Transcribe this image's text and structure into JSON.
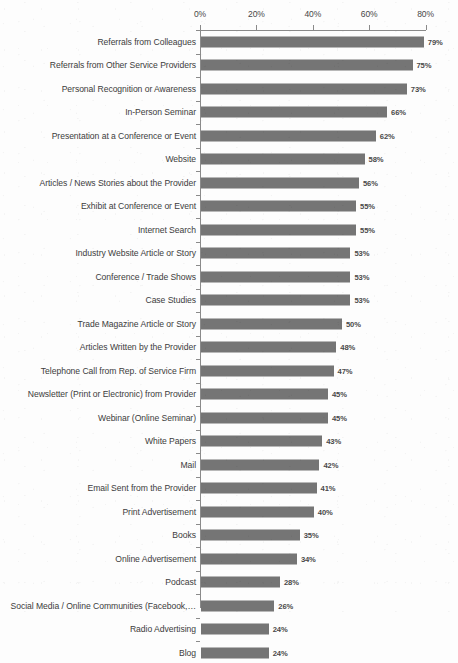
{
  "chart_data": {
    "type": "bar",
    "orientation": "horizontal",
    "title": "",
    "subtitle": "",
    "xlabel": "",
    "ylabel": "",
    "xlim": [
      0,
      80
    ],
    "xticks": [
      0,
      20,
      40,
      60,
      80
    ],
    "xtick_labels": [
      "0%",
      "20%",
      "40%",
      "60%",
      "80%"
    ],
    "grid": false,
    "legend": null,
    "value_label_suffix": "%",
    "bar_color": "#757575",
    "axis_color": "#8a8a8a",
    "text_color": "#3c3c3c",
    "background_color": "#fdfdfd",
    "categories": [
      "Referrals from Colleagues",
      "Referrals from Other Service Providers",
      "Personal Recognition or Awareness",
      "In-Person Seminar",
      "Presentation at a Conference or Event",
      "Website",
      "Articles / News Stories about the Provider",
      "Exhibit at Conference or Event",
      "Internet Search",
      "Industry Website Article or Story",
      "Conference / Trade Shows",
      "Case Studies",
      "Trade Magazine Article or Story",
      "Articles Written by the Provider",
      "Telephone Call from Rep. of  Service Firm",
      "Newsletter (Print or Electronic) from Provider",
      "Webinar (Online Seminar)",
      "White Papers",
      "Mail",
      "Email Sent from the Provider",
      "Print Advertisement",
      "Books",
      "Online Advertisement",
      "Podcast",
      "Social Media / Online Communities (Facebook,…",
      "Radio Advertising",
      "Blog"
    ],
    "values": [
      79,
      75,
      73,
      66,
      62,
      58,
      56,
      55,
      55,
      53,
      53,
      53,
      50,
      48,
      47,
      45,
      45,
      43,
      42,
      41,
      40,
      35,
      34,
      28,
      26,
      24,
      24
    ],
    "value_labels": [
      "79%",
      "75%",
      "73%",
      "66%",
      "62%",
      "58%",
      "56%",
      "55%",
      "55%",
      "53%",
      "53%",
      "53%",
      "50%",
      "48%",
      "47%",
      "45%",
      "45%",
      "43%",
      "42%",
      "41%",
      "40%",
      "35%",
      "34%",
      "28%",
      "26%",
      "24%",
      "24%"
    ]
  }
}
